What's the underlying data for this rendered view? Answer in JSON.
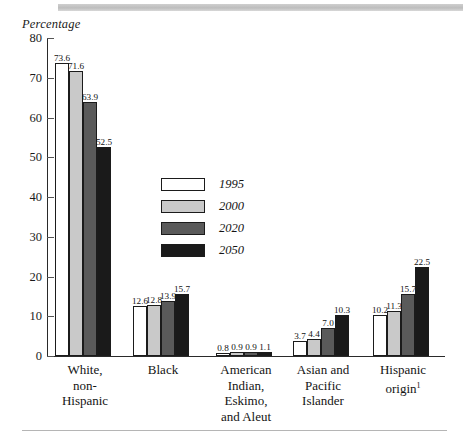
{
  "axis_title": "Percentage",
  "legend": {
    "entries": [
      {
        "label": "1995",
        "color": "#ffffff"
      },
      {
        "label": "2000",
        "color": "#c9c9c9"
      },
      {
        "label": "2020",
        "color": "#5a5a5a"
      },
      {
        "label": "2050",
        "color": "#1a1a1a"
      }
    ]
  },
  "yaxis": {
    "ticks": [
      "0",
      "10",
      "20",
      "30",
      "40",
      "50",
      "60",
      "70",
      "80"
    ]
  },
  "categories": [
    {
      "lines": [
        "White,",
        "non-",
        "Hispanic"
      ],
      "footnote": ""
    },
    {
      "lines": [
        "Black"
      ],
      "footnote": ""
    },
    {
      "lines": [
        "American",
        "Indian,",
        "Eskimo,",
        "and Aleut"
      ],
      "footnote": ""
    },
    {
      "lines": [
        "Asian and",
        "Pacific",
        "Islander"
      ],
      "footnote": ""
    },
    {
      "lines": [
        "Hispanic",
        "origin"
      ],
      "footnote": "1"
    }
  ],
  "chart_data": {
    "type": "bar",
    "title": "",
    "xlabel": "",
    "ylabel": "Percentage",
    "ylim": [
      0,
      80
    ],
    "ytick_step": 10,
    "grid": false,
    "legend_position": "center-inside",
    "categories": [
      "White, non-Hispanic",
      "Black",
      "American Indian, Eskimo, and Aleut",
      "Asian and Pacific Islander",
      "Hispanic origin"
    ],
    "series": [
      {
        "name": "1995",
        "color": "#ffffff",
        "values": [
          73.6,
          12.6,
          0.8,
          3.7,
          10.2
        ]
      },
      {
        "name": "2000",
        "color": "#c9c9c9",
        "values": [
          71.6,
          12.8,
          0.9,
          4.4,
          11.3
        ]
      },
      {
        "name": "2020",
        "color": "#5a5a5a",
        "values": [
          63.9,
          13.9,
          0.9,
          7.0,
          15.7
        ]
      },
      {
        "name": "2050",
        "color": "#1a1a1a",
        "values": [
          52.5,
          15.7,
          1.1,
          10.3,
          22.5
        ]
      }
    ],
    "data_labels": [
      [
        "73.6",
        "71.6",
        "63.9",
        "52.5"
      ],
      [
        "12.6",
        "12.8",
        "13.9",
        "15.7"
      ],
      [
        "0.8",
        "0.9",
        "0.9",
        "1.1"
      ],
      [
        "3.7",
        "4.4",
        "7.0",
        "10.3"
      ],
      [
        "10.2",
        "11.3",
        "15.7",
        "22.5"
      ]
    ]
  },
  "layout": {
    "group_left": [
      55,
      133,
      216,
      293,
      373
    ],
    "group_bar_width": 14,
    "group_bar_gap": 0,
    "cat_label_left": [
      45,
      123,
      206,
      283,
      363
    ],
    "cat_label_width": 80
  }
}
